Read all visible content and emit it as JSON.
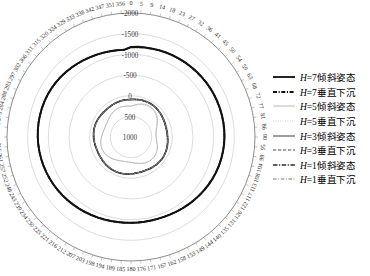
{
  "chart_data": {
    "type": "line",
    "subtype": "polar",
    "title": "",
    "xlabel": "",
    "ylabel": "",
    "grid": true,
    "legend_position": "right",
    "radial_axis": {
      "tick_labels": [
        "-2000",
        "-1500",
        "-1000",
        "-500",
        "0",
        "500",
        "1000"
      ],
      "tick_values": [
        -2000,
        -1500,
        -1000,
        -500,
        0,
        500,
        1000
      ],
      "inverted": true,
      "rlim": [
        -2000,
        1000
      ]
    },
    "angular_axis": {
      "units": "degrees",
      "direction": "clockwise",
      "zero_location": "N",
      "tick_labels": [
        "0",
        "5",
        "9",
        "14",
        "18",
        "23",
        "27",
        "32",
        "36",
        "41",
        "45",
        "50",
        "54",
        "59",
        "63",
        "68",
        "72",
        "77",
        "81",
        "86",
        "90",
        "95",
        "99",
        "104",
        "108",
        "113",
        "117",
        "122",
        "126",
        "131",
        "135",
        "140",
        "144",
        "149",
        "153",
        "158",
        "162",
        "167",
        "171",
        "176",
        "180",
        "185",
        "189",
        "194",
        "198",
        "203",
        "207",
        "212",
        "216",
        "221",
        "225",
        "230",
        "234",
        "239",
        "243",
        "248",
        "252",
        "257",
        "261",
        "266",
        "270",
        "275",
        "279",
        "284",
        "288",
        "293",
        "297",
        "302",
        "306",
        "311",
        "315",
        "320",
        "324",
        "329",
        "333",
        "338",
        "342",
        "347",
        "351",
        "356"
      ]
    },
    "series": [
      {
        "name": "H=7倾斜姿态",
        "h": 7,
        "mode": "倾斜姿态",
        "style": "solid",
        "width": 1.9,
        "color": "#1a1a1a",
        "mean_r": -1180,
        "values": [
          -1180,
          -1190,
          -1195,
          -1200,
          -1210,
          -1215,
          -1220,
          -1225,
          -1230,
          -1235,
          -1240,
          -1245,
          -1250,
          -1255,
          -1258,
          -1260,
          -1262,
          -1264,
          -1265,
          -1265,
          -1263,
          -1260,
          -1255,
          -1248,
          -1240,
          -1230,
          -1218,
          -1205,
          -1190,
          -1175,
          -1160,
          -1145,
          -1130,
          -1115,
          -1100,
          -1090,
          -1082,
          -1078,
          -1075,
          -1074,
          -1075,
          -1078,
          -1082,
          -1088,
          -1096,
          -1105,
          -1115,
          -1126,
          -1138,
          -1150,
          -1162,
          -1174,
          -1186,
          -1198,
          -1208,
          -1218,
          -1228,
          -1236,
          -1244,
          -1250,
          -1256,
          -1260,
          -1263,
          -1265,
          -1266,
          -1265,
          -1262,
          -1256,
          -1248,
          -1238,
          -1226,
          -1212,
          -1198,
          -1184,
          -1170,
          -1157,
          -1145,
          -1134,
          -1124,
          -1115
        ]
      },
      {
        "name": "H=7垂直下沉",
        "h": 7,
        "mode": "垂直下沉",
        "style": "dashdot",
        "width": 1.9,
        "color": "#111111",
        "mean_r": -1170,
        "values": [
          -1170,
          -1180,
          -1188,
          -1194,
          -1202,
          -1208,
          -1214,
          -1220,
          -1226,
          -1231,
          -1236,
          -1241,
          -1246,
          -1250,
          -1253,
          -1255,
          -1257,
          -1259,
          -1260,
          -1260,
          -1258,
          -1255,
          -1250,
          -1243,
          -1235,
          -1225,
          -1213,
          -1200,
          -1186,
          -1171,
          -1156,
          -1142,
          -1128,
          -1114,
          -1100,
          -1090,
          -1083,
          -1079,
          -1077,
          -1076,
          -1078,
          -1081,
          -1086,
          -1093,
          -1101,
          -1110,
          -1121,
          -1132,
          -1144,
          -1156,
          -1168,
          -1180,
          -1191,
          -1202,
          -1212,
          -1221,
          -1230,
          -1238,
          -1245,
          -1251,
          -1256,
          -1260,
          -1263,
          -1264,
          -1265,
          -1264,
          -1260,
          -1254,
          -1246,
          -1236,
          -1224,
          -1211,
          -1197,
          -1183,
          -1170,
          -1157,
          -1146,
          -1136,
          -1127,
          -1118
        ]
      },
      {
        "name": "H=5倾斜姿态",
        "h": 5,
        "mode": "倾斜姿态",
        "style": "solid",
        "width": 0.7,
        "color": "#a8a8a8",
        "mean_r": 260,
        "values": [
          250,
          230,
          205,
          180,
          160,
          145,
          135,
          130,
          132,
          142,
          160,
          185,
          215,
          250,
          285,
          320,
          350,
          372,
          386,
          392,
          390,
          382,
          368,
          350,
          330,
          310,
          292,
          278,
          268,
          262,
          260,
          262,
          268,
          278,
          292,
          308,
          326,
          344,
          360,
          374,
          384,
          390,
          392,
          390,
          384,
          374,
          360,
          344,
          326,
          308,
          290,
          274,
          260,
          250,
          244,
          242,
          244,
          250,
          260,
          272,
          286,
          300,
          312,
          322,
          328,
          330,
          328,
          322,
          312,
          300,
          286,
          272,
          258,
          246,
          238,
          234,
          234,
          238,
          244,
          248
        ]
      },
      {
        "name": "H=5垂直下沉",
        "h": 5,
        "mode": "垂直下沉",
        "style": "dotted",
        "width": 0.8,
        "color": "#bdbdbd",
        "mean_r": 270,
        "values": [
          262,
          244,
          220,
          196,
          176,
          162,
          152,
          148,
          150,
          160,
          178,
          202,
          232,
          266,
          300,
          332,
          360,
          380,
          392,
          396,
          394,
          386,
          372,
          354,
          334,
          314,
          296,
          282,
          272,
          266,
          264,
          266,
          272,
          282,
          296,
          312,
          330,
          348,
          362,
          376,
          386,
          392,
          394,
          392,
          386,
          376,
          362,
          346,
          328,
          310,
          292,
          276,
          262,
          252,
          246,
          244,
          246,
          252,
          262,
          274,
          288,
          302,
          314,
          324,
          330,
          332,
          330,
          324,
          314,
          302,
          288,
          274,
          260,
          248,
          240,
          236,
          236,
          240,
          246,
          252
        ]
      },
      {
        "name": "H=3倾斜姿态",
        "h": 3,
        "mode": "倾斜姿态",
        "style": "solid",
        "width": 1.35,
        "color": "#6e6e6e",
        "mean_r": 95,
        "values": [
          95,
          90,
          84,
          78,
          72,
          68,
          66,
          66,
          68,
          72,
          78,
          86,
          95,
          104,
          112,
          118,
          122,
          124,
          124,
          122,
          118,
          112,
          105,
          98,
          92,
          87,
          84,
          83,
          84,
          87,
          92,
          98,
          105,
          112,
          118,
          122,
          124,
          124,
          122,
          118,
          112,
          105,
          98,
          92,
          88,
          86,
          86,
          88,
          92,
          97,
          103,
          109,
          114,
          118,
          120,
          120,
          118,
          114,
          109,
          103,
          97,
          92,
          88,
          86,
          86,
          88,
          92,
          97,
          102,
          106,
          109,
          110,
          109,
          106,
          102,
          98,
          95,
          93,
          93,
          94
        ]
      },
      {
        "name": "H=3垂直下沉",
        "h": 3,
        "mode": "垂直下沉",
        "style": "dashed",
        "width": 1.2,
        "color": "#4a4a4a",
        "mean_r": 100,
        "values": [
          100,
          95,
          88,
          82,
          76,
          72,
          70,
          70,
          72,
          76,
          82,
          90,
          99,
          108,
          116,
          122,
          126,
          128,
          128,
          126,
          122,
          116,
          109,
          102,
          96,
          91,
          88,
          87,
          88,
          91,
          96,
          102,
          109,
          116,
          122,
          126,
          128,
          128,
          126,
          122,
          116,
          109,
          102,
          96,
          92,
          90,
          90,
          92,
          96,
          101,
          107,
          113,
          118,
          122,
          124,
          124,
          122,
          118,
          113,
          107,
          101,
          96,
          92,
          90,
          90,
          92,
          96,
          101,
          106,
          110,
          113,
          114,
          113,
          110,
          106,
          102,
          99,
          97,
          97,
          98
        ]
      },
      {
        "name": "H=1倾斜姿态",
        "h": 1,
        "mode": "倾斜姿态",
        "style": "dashdotdash",
        "width": 1.6,
        "color": "#2b2b2b",
        "mean_r": 88,
        "values": [
          88,
          84,
          79,
          74,
          69,
          65,
          63,
          63,
          65,
          69,
          75,
          82,
          90,
          98,
          105,
          111,
          115,
          117,
          117,
          115,
          111,
          105,
          99,
          93,
          88,
          84,
          81,
          80,
          81,
          84,
          88,
          93,
          99,
          105,
          111,
          115,
          117,
          117,
          115,
          111,
          105,
          99,
          93,
          88,
          85,
          83,
          83,
          85,
          88,
          93,
          98,
          104,
          109,
          113,
          115,
          115,
          113,
          109,
          104,
          98,
          93,
          88,
          85,
          83,
          83,
          85,
          88,
          93,
          97,
          101,
          104,
          105,
          104,
          101,
          97,
          94,
          91,
          89,
          89,
          90
        ]
      },
      {
        "name": "H=1垂直下沉",
        "h": 1,
        "mode": "垂直下沉",
        "style": "dashplus",
        "width": 1.1,
        "color": "#7a7a7a",
        "mean_r": 92,
        "values": [
          92,
          88,
          83,
          78,
          73,
          69,
          67,
          67,
          69,
          73,
          79,
          86,
          94,
          102,
          109,
          115,
          119,
          121,
          121,
          119,
          115,
          109,
          103,
          97,
          92,
          88,
          85,
          84,
          85,
          88,
          92,
          97,
          103,
          109,
          115,
          119,
          121,
          121,
          119,
          115,
          109,
          103,
          97,
          92,
          89,
          87,
          87,
          89,
          92,
          97,
          102,
          108,
          113,
          117,
          119,
          119,
          117,
          113,
          108,
          102,
          97,
          92,
          89,
          87,
          87,
          89,
          92,
          97,
          101,
          105,
          108,
          109,
          108,
          105,
          101,
          98,
          95,
          93,
          93,
          94
        ]
      }
    ]
  },
  "caption": {
    "text": ""
  }
}
